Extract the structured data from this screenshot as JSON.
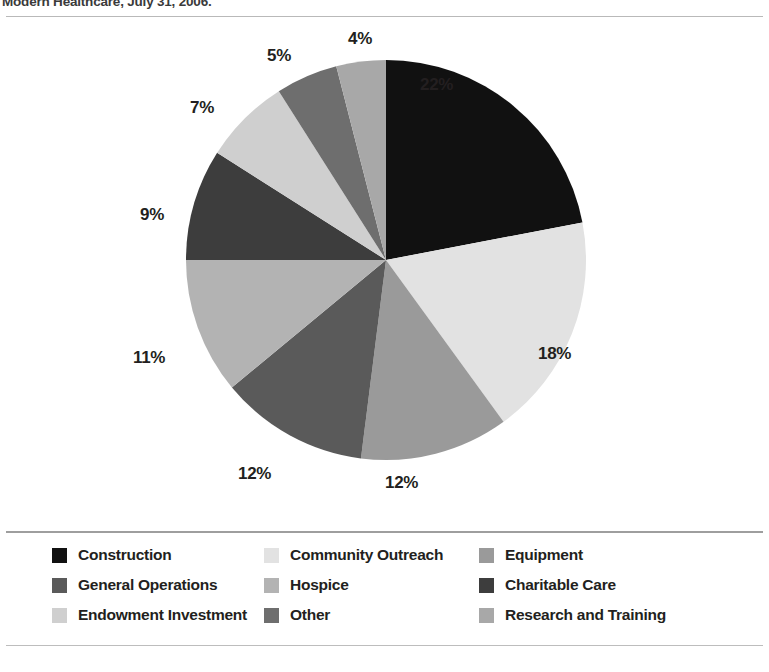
{
  "caption": {
    "text": "Modern Healthcare, July 31, 2006."
  },
  "chart_data": {
    "type": "pie",
    "title": "",
    "subtitle": "",
    "xlabel": "",
    "ylabel": "",
    "legend_position": "bottom",
    "grid": false,
    "start_angle_deg": 0,
    "direction": "clockwise",
    "unit": "%",
    "categories": [
      "Construction",
      "Community Outreach",
      "Equipment",
      "General Operations",
      "Hospice",
      "Charitable Care",
      "Endowment Investment",
      "Other",
      "Research and Training"
    ],
    "values": [
      22,
      18,
      12,
      12,
      11,
      9,
      7,
      5,
      4
    ],
    "labels": [
      "22%",
      "18%",
      "12%",
      "12%",
      "11%",
      "9%",
      "7%",
      "5%",
      "4%"
    ],
    "colors": [
      "#111111",
      "#e2e2e2",
      "#9a9a9a",
      "#5a5a5a",
      "#b3b3b3",
      "#3d3d3d",
      "#cfcfcf",
      "#6e6e6e",
      "#a8a8a8"
    ],
    "slices": [
      {
        "label": "Construction",
        "value": 22,
        "display": "22%",
        "color": "#111111"
      },
      {
        "label": "Community Outreach",
        "value": 18,
        "display": "18%",
        "color": "#e2e2e2"
      },
      {
        "label": "Equipment",
        "value": 12,
        "display": "12%",
        "color": "#9a9a9a"
      },
      {
        "label": "General Operations",
        "value": 12,
        "display": "12%",
        "color": "#5a5a5a"
      },
      {
        "label": "Hospice",
        "value": 11,
        "display": "11%",
        "color": "#b3b3b3"
      },
      {
        "label": "Charitable Care",
        "value": 9,
        "display": "9%",
        "color": "#3d3d3d"
      },
      {
        "label": "Endowment Investment",
        "value": 7,
        "display": "7%",
        "color": "#cfcfcf"
      },
      {
        "label": "Other",
        "value": 5,
        "display": "5%",
        "color": "#6e6e6e"
      },
      {
        "label": "Research and Training",
        "value": 4,
        "display": "4%",
        "color": "#a8a8a8"
      }
    ]
  },
  "pie_labels": {
    "l0": "22%",
    "l1": "18%",
    "l2": "12%",
    "l3": "12%",
    "l4": "11%",
    "l5": "9%",
    "l6": "7%",
    "l7": "5%",
    "l8": "4%"
  },
  "legend": {
    "items": [
      {
        "label": "Construction",
        "color": "#111111"
      },
      {
        "label": "Community Outreach",
        "color": "#e2e2e2"
      },
      {
        "label": "Equipment",
        "color": "#9a9a9a"
      },
      {
        "label": "General Operations",
        "color": "#5a5a5a"
      },
      {
        "label": "Hospice",
        "color": "#b3b3b3"
      },
      {
        "label": "Charitable Care",
        "color": "#3d3d3d"
      },
      {
        "label": "Endowment Investment",
        "color": "#cfcfcf"
      },
      {
        "label": "Other",
        "color": "#6e6e6e"
      },
      {
        "label": "Research and Training",
        "color": "#a8a8a8"
      }
    ]
  }
}
